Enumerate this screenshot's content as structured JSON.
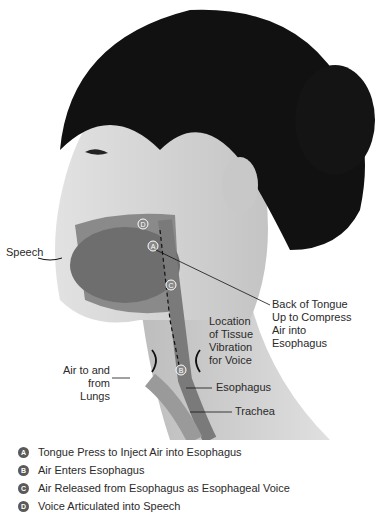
{
  "figure": {
    "labels": {
      "speech": "Speech",
      "back_of_tongue": [
        "Back of Tongue",
        "Up to Compress",
        "Air into",
        "Esophagus"
      ],
      "tissue_vibration": [
        "Location",
        "of Tissue",
        "Vibration",
        "for Voice"
      ],
      "air_lungs": [
        "Air to and",
        "from Lungs"
      ],
      "esophagus": "Esophagus",
      "trachea": "Trachea"
    },
    "markers": [
      "A",
      "B",
      "C",
      "D"
    ],
    "colors": {
      "hair": "#111111",
      "skin": "#d6d6d6",
      "tissue": "#8a8a8a",
      "text": "#2a2a2a"
    }
  },
  "legend": [
    {
      "marker": "A",
      "text": "Tongue Press to Inject Air into Esophagus"
    },
    {
      "marker": "B",
      "text": "Air Enters Esophagus"
    },
    {
      "marker": "C",
      "text": "Air Released from Esophagus as Esophageal Voice"
    },
    {
      "marker": "D",
      "text": "Voice Articulated into Speech"
    }
  ]
}
